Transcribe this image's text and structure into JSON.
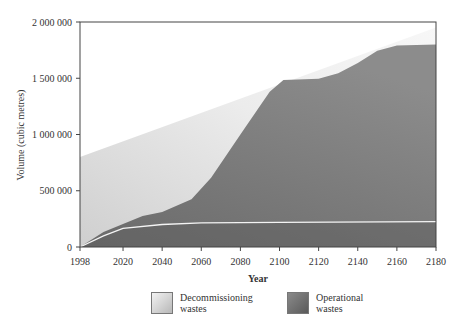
{
  "chart_data": {
    "type": "area",
    "title": "",
    "xlabel": "Year",
    "ylabel": "Volume (cubic metres)",
    "xlim": [
      1998,
      2180
    ],
    "ylim": [
      0,
      2000000
    ],
    "x_ticks": [
      1998,
      2020,
      2040,
      2060,
      2080,
      2100,
      2120,
      2140,
      2160,
      2180
    ],
    "y_ticks": [
      0,
      500000,
      1000000,
      1500000,
      2000000
    ],
    "y_tick_labels": [
      "0",
      "500 000",
      "1 000 000",
      "1 500 000",
      "2 000 000"
    ],
    "grid": false,
    "stacked": true,
    "legend_position": "bottom",
    "series": [
      {
        "name": "Operational wastes",
        "color": "#6e6e6e",
        "x": [
          1998,
          2010,
          2020,
          2030,
          2040,
          2055,
          2065,
          2080,
          2095,
          2102,
          2120,
          2130,
          2140,
          2150,
          2160,
          2180
        ],
        "cumulative_values": [
          0,
          133000,
          205000,
          275000,
          310000,
          425000,
          615000,
          1000000,
          1380000,
          1485000,
          1495000,
          1545000,
          1635000,
          1745000,
          1790000,
          1800000
        ]
      },
      {
        "name": "Decommissioning wastes",
        "color": "#d9d9d9",
        "x": [
          1998,
          2180
        ],
        "cumulative_values": [
          800000,
          1950000
        ]
      }
    ],
    "inner_line": {
      "description": "white line within operational wastes area",
      "x": [
        1998,
        2010,
        2020,
        2040,
        2060,
        2100,
        2180
      ],
      "values": [
        0,
        100000,
        165000,
        200000,
        215000,
        220000,
        225000
      ]
    }
  },
  "legend": {
    "items": [
      {
        "label_line1": "Decommissioning",
        "label_line2": "wastes"
      },
      {
        "label_line1": "Operational",
        "label_line2": "wastes"
      }
    ]
  }
}
